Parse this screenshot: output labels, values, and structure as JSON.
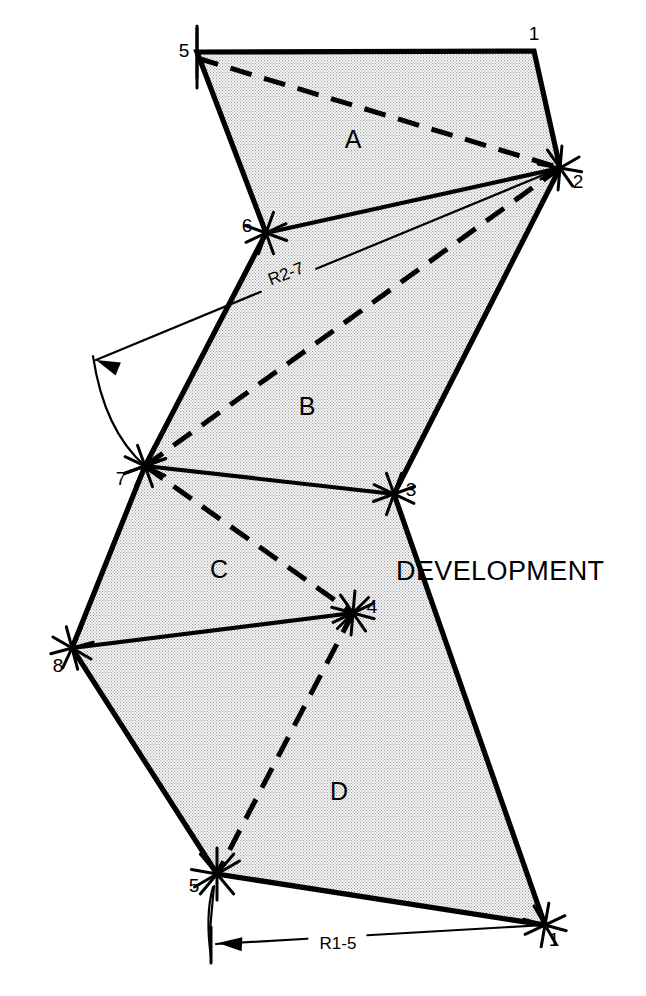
{
  "figure": {
    "title": "DEVELOPMENT",
    "title_pos": {
      "x": 396,
      "y": 580
    },
    "background": "#ffffff",
    "line_color": "#000000",
    "fill_pattern": "stipple-dot-gray",
    "fill_color": "#f2f2f2",
    "dot_color": "#8a8a8a"
  },
  "panels": [
    {
      "label": "A",
      "x": 353,
      "y": 148
    },
    {
      "label": "B",
      "x": 307,
      "y": 415
    },
    {
      "label": "C",
      "x": 219,
      "y": 578
    },
    {
      "label": "D",
      "x": 339,
      "y": 800
    }
  ],
  "vertices": [
    {
      "id": "v5_top",
      "label": "5",
      "x": 197,
      "y": 52,
      "lx": 184,
      "ly": 57
    },
    {
      "id": "v1_top",
      "label": "1",
      "x": 534,
      "y": 51,
      "lx": 534,
      "ly": 40
    },
    {
      "id": "v2",
      "label": "2",
      "x": 560,
      "y": 168,
      "lx": 578,
      "ly": 188
    },
    {
      "id": "v6",
      "label": "6",
      "x": 266,
      "y": 233,
      "lx": 247,
      "ly": 232
    },
    {
      "id": "v7",
      "label": "7",
      "x": 145,
      "y": 466,
      "lx": 121,
      "ly": 485
    },
    {
      "id": "v3",
      "label": "3",
      "x": 394,
      "y": 494,
      "lx": 411,
      "ly": 496
    },
    {
      "id": "v8",
      "label": "8",
      "x": 72,
      "y": 648,
      "lx": 58,
      "ly": 672
    },
    {
      "id": "v4",
      "label": "4",
      "x": 353,
      "y": 613,
      "lx": 372,
      "ly": 613
    },
    {
      "id": "v5_bot",
      "label": "5",
      "x": 217,
      "y": 874,
      "lx": 194,
      "ly": 892
    },
    {
      "id": "v1_bot",
      "label": "1",
      "x": 545,
      "y": 925,
      "lx": 554,
      "ly": 946
    }
  ],
  "outline_path": "M 197 52 L 534 51 L 560 168 L 394 494 L 545 925 L 217 874 L 72 648 L 145 466 L 266 233 Z",
  "fold_lines": [
    {
      "name": "fold-2-6",
      "from": "v2",
      "to": "v6",
      "x1": 560,
      "y1": 168,
      "x2": 266,
      "y2": 233
    },
    {
      "name": "fold-7-3",
      "from": "v7",
      "to": "v3",
      "x1": 145,
      "y1": 466,
      "x2": 394,
      "y2": 494
    },
    {
      "name": "fold-8-4",
      "from": "v8",
      "to": "v4",
      "x1": 72,
      "y1": 648,
      "x2": 353,
      "y2": 613
    }
  ],
  "dashed_lines": [
    {
      "name": "dash-5-2",
      "x1": 197,
      "y1": 58,
      "x2": 560,
      "y2": 168
    },
    {
      "name": "dash-7-2",
      "x1": 145,
      "y1": 466,
      "x2": 560,
      "y2": 168
    },
    {
      "name": "dash-7-4",
      "x1": 145,
      "y1": 466,
      "x2": 353,
      "y2": 613
    },
    {
      "name": "dash-4-5",
      "x1": 353,
      "y1": 613,
      "x2": 217,
      "y2": 874
    }
  ],
  "dimensions": [
    {
      "name": "radius-2-7",
      "label": "R2-7",
      "label_x": 288,
      "label_y": 279,
      "label_rotate": -21,
      "leader": {
        "x1": 560,
        "y1": 168,
        "x2": 96,
        "y2": 360
      },
      "arc": {
        "d": "M 93 356 Q 104 430 145 466"
      },
      "arrow_at": {
        "x": 96,
        "y": 360,
        "angle": 202
      }
    },
    {
      "name": "radius-1-5",
      "label": "R1-5",
      "label_x": 338,
      "label_y": 949,
      "label_rotate": 0,
      "leader": {
        "x1": 545,
        "y1": 925,
        "x2": 216,
        "y2": 944
      },
      "arc": {
        "d": "M 213 887 Q 205 915 211 957"
      },
      "arrow_at": {
        "x": 218,
        "y": 943,
        "angle": 183
      }
    }
  ],
  "tick_marks_note": "short crossed hatch ticks at each numbered vertex"
}
